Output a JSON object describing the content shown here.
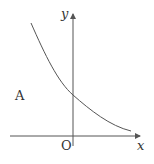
{
  "diagram": {
    "type": "function-graph",
    "labels": {
      "y_axis": "y",
      "x_axis": "x",
      "origin": "O",
      "graph_label": "A"
    },
    "colors": {
      "axis": "#555555",
      "curve": "#555555",
      "text": "#333333",
      "background": "#ffffff"
    }
  }
}
